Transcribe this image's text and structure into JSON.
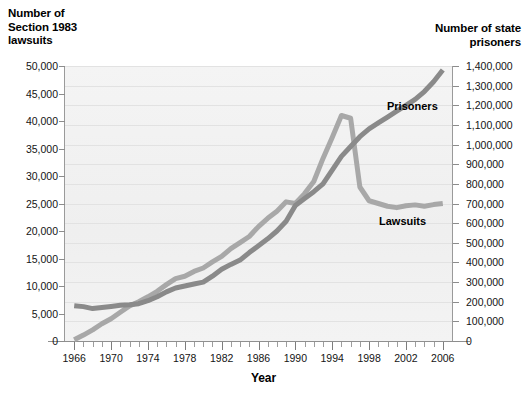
{
  "chart_data": {
    "type": "line",
    "title": "",
    "xlabel": "Year",
    "left_axis_title": "Number of\nSection 1983\nlawsuits",
    "right_axis_title": "Number of state\nprisoners",
    "grid": true,
    "legend_position": "inline-annotation",
    "x": [
      1966,
      1967,
      1968,
      1969,
      1970,
      1971,
      1972,
      1973,
      1974,
      1975,
      1976,
      1977,
      1978,
      1979,
      1980,
      1981,
      1982,
      1983,
      1984,
      1985,
      1986,
      1987,
      1988,
      1989,
      1990,
      1991,
      1992,
      1993,
      1994,
      1995,
      1996,
      1997,
      1998,
      1999,
      2000,
      2001,
      2002,
      2003,
      2004,
      2005,
      2006
    ],
    "xlim": [
      1965,
      2007
    ],
    "xticks": [
      1966,
      1970,
      1974,
      1978,
      1982,
      1986,
      1990,
      1994,
      1998,
      2002,
      2006
    ],
    "xtick_labels": [
      "1966",
      "1970",
      "1974",
      "1978",
      "1982",
      "1986",
      "1990",
      "1994",
      "1998",
      "2002",
      "2006"
    ],
    "left_axis": {
      "label": "Number of Section 1983 lawsuits",
      "ylim": [
        0,
        50000
      ],
      "ticks": [
        0,
        5000,
        10000,
        15000,
        20000,
        25000,
        30000,
        35000,
        40000,
        45000,
        50000
      ],
      "tick_labels": [
        "0",
        "5,000",
        "10,000",
        "15,000",
        "20,000",
        "25,000",
        "30,000",
        "35,000",
        "40,000",
        "45,000",
        "50,000"
      ]
    },
    "right_axis": {
      "label": "Number of state prisoners",
      "ylim": [
        0,
        1400000
      ],
      "ticks": [
        0,
        100000,
        200000,
        300000,
        400000,
        500000,
        600000,
        700000,
        800000,
        900000,
        1000000,
        1100000,
        1200000,
        1300000,
        1400000
      ],
      "tick_labels": [
        "0",
        "100,000",
        "200,000",
        "300,000",
        "400,000",
        "500,000",
        "600,000",
        "700,000",
        "800,000",
        "900,000",
        "1,000,000",
        "1,100,000",
        "1,200,000",
        "1,300,000",
        "1,400,000"
      ]
    },
    "series": [
      {
        "name": "Lawsuits",
        "axis": "left",
        "color": "#a8a8a8",
        "label_text": "Lawsuits",
        "values": [
          218,
          1072,
          2028,
          3143,
          4050,
          5215,
          6375,
          7142,
          8038,
          9040,
          10245,
          11350,
          11765,
          12650,
          13275,
          14375,
          15375,
          16800,
          17900,
          19000,
          20800,
          22300,
          23600,
          25300,
          25000,
          26800,
          29000,
          33200,
          37000,
          41000,
          40500,
          28000,
          25500,
          25000,
          24500,
          24250,
          24600,
          24750,
          24500,
          24800,
          25000
        ]
      },
      {
        "name": "Prisoners",
        "axis": "right",
        "color": "#8a8a8a",
        "label_text": "Prisoners",
        "values": [
          180000,
          175000,
          165000,
          170000,
          176000,
          182000,
          185000,
          190000,
          205000,
          225000,
          250000,
          270000,
          280000,
          290000,
          300000,
          330000,
          365000,
          390000,
          412000,
          450000,
          485000,
          520000,
          560000,
          610000,
          690000,
          725000,
          760000,
          800000,
          870000,
          940000,
          990000,
          1040000,
          1080000,
          1110000,
          1140000,
          1170000,
          1200000,
          1230000,
          1270000,
          1320000,
          1380000
        ]
      }
    ]
  }
}
